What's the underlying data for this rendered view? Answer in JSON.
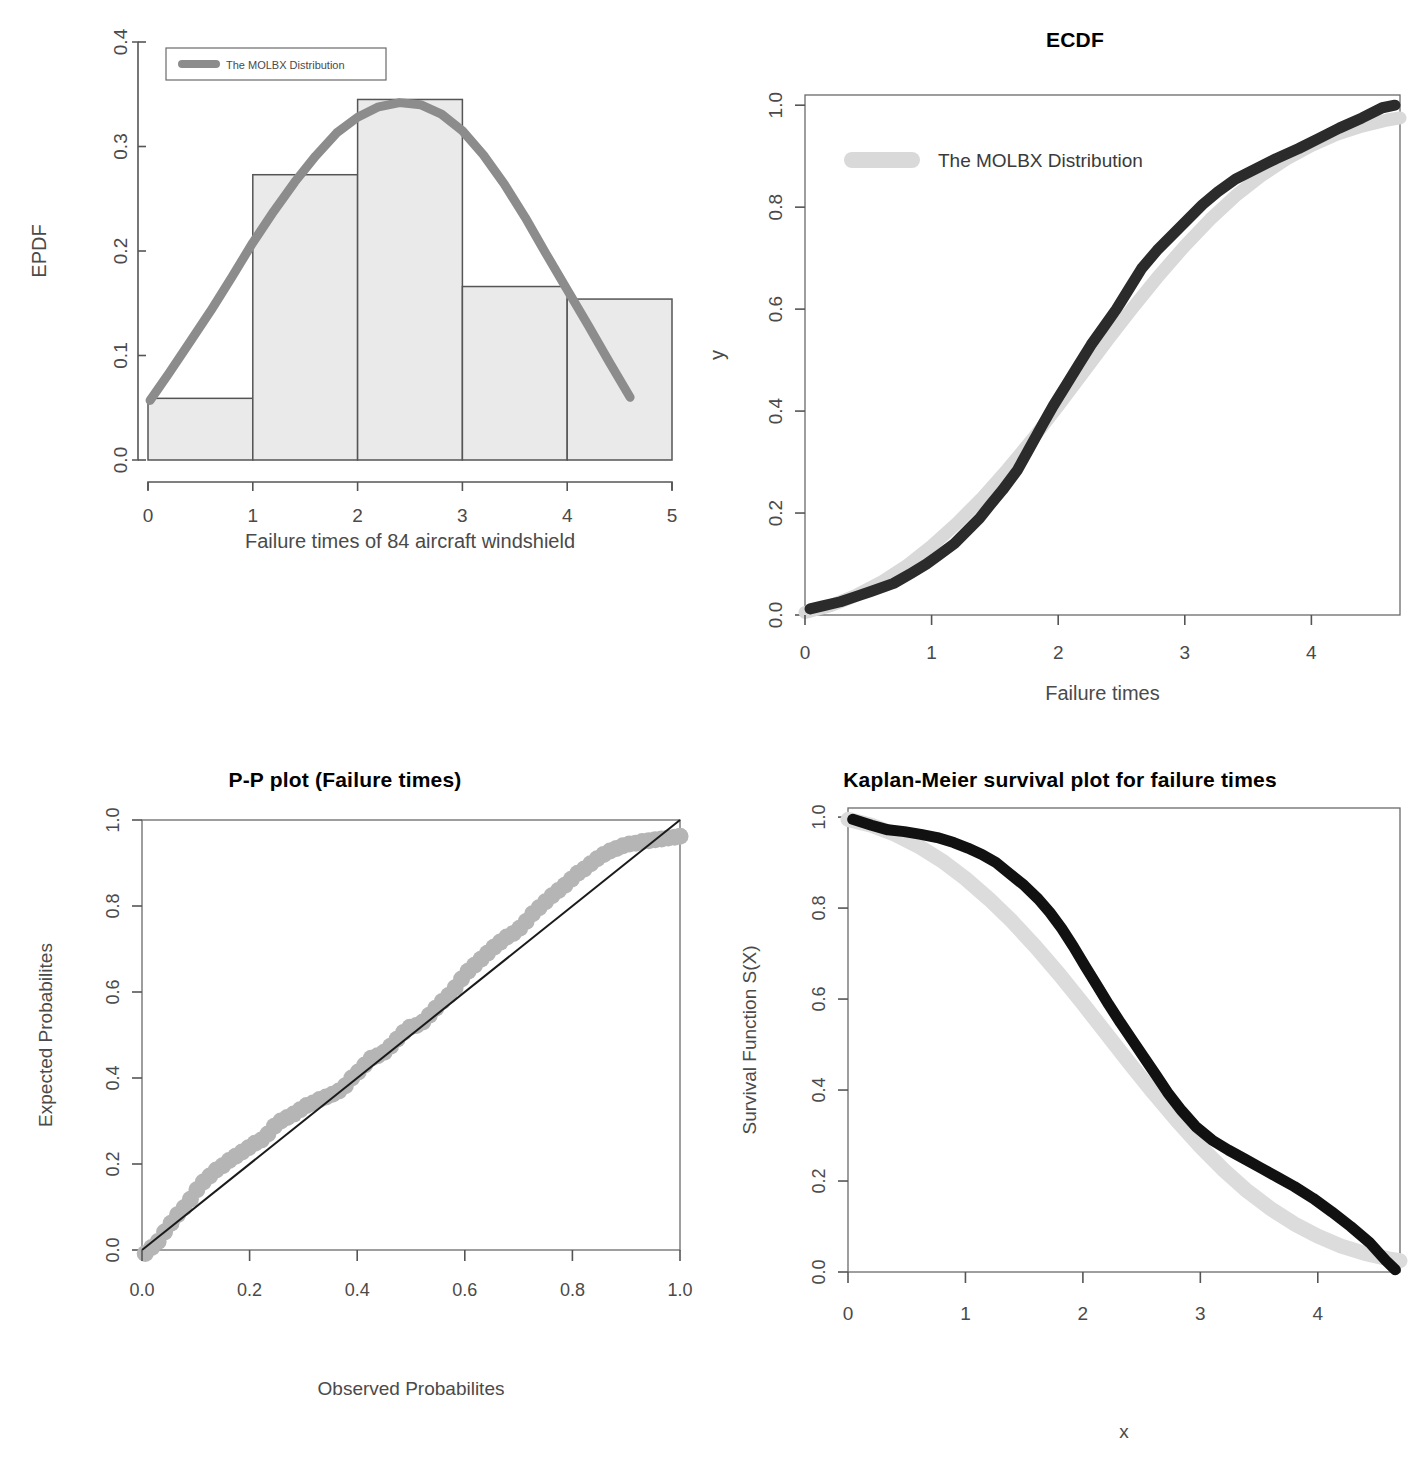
{
  "figure": {
    "background": "#ffffff",
    "panel_count": 4
  },
  "colors": {
    "curve_gray": "#8c8c8c",
    "curve_lightgray": "#d9d9d9",
    "curve_dark": "#2b2b2b",
    "hist_fill": "#eaeaea",
    "hist_stroke": "#555555",
    "axis": "#555555",
    "text": "#3a3a3a",
    "title": "#000000"
  },
  "panels": {
    "epdf": {
      "title": "",
      "xlabel": "Failure times of 84 aircraft windshield",
      "ylabel": "EPDF",
      "legend": {
        "label": "The MOLBX Distribution",
        "swatch_color": "#8c8c8c"
      },
      "xticks": [
        "0",
        "1",
        "2",
        "3",
        "4",
        "5"
      ],
      "yticks": [
        "0.0",
        "0.1",
        "0.2",
        "0.3",
        "0.4"
      ]
    },
    "ecdf": {
      "title": "ECDF",
      "xlabel": "Failure times",
      "ylabel": "y",
      "legend": {
        "label": "The MOLBX Distribution",
        "swatch_color": "#d9d9d9"
      },
      "xticks": [
        "0",
        "1",
        "2",
        "3",
        "4"
      ],
      "yticks": [
        "0.0",
        "0.2",
        "0.4",
        "0.6",
        "0.8",
        "1.0"
      ]
    },
    "pp": {
      "title": "P-P plot (Failure times)",
      "xlabel": "Observed Probabilites",
      "ylabel": "Expected Probabilites",
      "xticks": [
        "0.0",
        "0.2",
        "0.4",
        "0.6",
        "0.8",
        "1.0"
      ],
      "yticks": [
        "0.0",
        "0.2",
        "0.4",
        "0.6",
        "0.8",
        "1.0"
      ]
    },
    "km": {
      "title": "Kaplan-Meier survival plot for failure times",
      "xlabel": "x",
      "ylabel": "Survival  Function S(X)",
      "xticks": [
        "0",
        "1",
        "2",
        "3",
        "4"
      ],
      "yticks": [
        "0.0",
        "0.2",
        "0.4",
        "0.6",
        "0.8",
        "1.0"
      ]
    }
  },
  "chart_data": [
    {
      "id": "epdf",
      "type": "bar",
      "title": "",
      "xlabel": "Failure times of 84 aircraft windshield",
      "ylabel": "EPDF",
      "xlim": [
        0,
        5
      ],
      "ylim": [
        0,
        0.4
      ],
      "grid": false,
      "legend": [
        "The MOLBX Distribution"
      ],
      "legend_position": "top-left",
      "bin_edges": [
        0,
        1,
        2,
        3,
        4,
        5
      ],
      "categories": [
        "0-1",
        "1-2",
        "2-3",
        "3-4",
        "4-5"
      ],
      "values": [
        0.059,
        0.273,
        0.345,
        0.166,
        0.154
      ],
      "overlay_series": {
        "name": "The MOLBX Distribution",
        "color": "#8c8c8c",
        "x": [
          0.02,
          0.2,
          0.4,
          0.6,
          0.8,
          1.0,
          1.2,
          1.4,
          1.6,
          1.8,
          2.0,
          2.2,
          2.4,
          2.6,
          2.8,
          3.0,
          3.2,
          3.4,
          3.6,
          3.8,
          4.0,
          4.2,
          4.4,
          4.6
        ],
        "y": [
          0.057,
          0.083,
          0.113,
          0.143,
          0.175,
          0.208,
          0.238,
          0.266,
          0.291,
          0.313,
          0.328,
          0.338,
          0.342,
          0.34,
          0.331,
          0.315,
          0.292,
          0.264,
          0.232,
          0.197,
          0.163,
          0.129,
          0.094,
          0.06
        ]
      }
    },
    {
      "id": "ecdf",
      "type": "line",
      "title": "ECDF",
      "xlabel": "Failure times",
      "ylabel": "y",
      "xlim": [
        0,
        4.7
      ],
      "ylim": [
        0,
        1.02
      ],
      "grid": false,
      "legend": [
        "The MOLBX Distribution"
      ],
      "legend_position": "top-left",
      "series": [
        {
          "name": "Empirical CDF",
          "color": "#2b2b2b",
          "x": [
            0.04,
            0.14,
            0.28,
            0.4,
            0.52,
            0.7,
            0.84,
            0.96,
            1.06,
            1.18,
            1.28,
            1.38,
            1.46,
            1.56,
            1.68,
            1.78,
            1.88,
            1.96,
            2.06,
            2.16,
            2.26,
            2.36,
            2.46,
            2.56,
            2.66,
            2.78,
            2.9,
            3.02,
            3.14,
            3.26,
            3.4,
            3.56,
            3.72,
            3.9,
            4.06,
            4.22,
            4.4,
            4.56,
            4.66
          ],
          "y": [
            0.012,
            0.018,
            0.026,
            0.036,
            0.046,
            0.062,
            0.082,
            0.1,
            0.118,
            0.14,
            0.165,
            0.19,
            0.215,
            0.245,
            0.285,
            0.33,
            0.375,
            0.41,
            0.45,
            0.49,
            0.53,
            0.565,
            0.6,
            0.64,
            0.68,
            0.715,
            0.745,
            0.775,
            0.805,
            0.83,
            0.855,
            0.875,
            0.895,
            0.915,
            0.935,
            0.955,
            0.975,
            0.995,
            1.0
          ]
        },
        {
          "name": "The MOLBX Distribution",
          "color": "#d9d9d9",
          "x": [
            0.0,
            0.2,
            0.4,
            0.6,
            0.8,
            1.0,
            1.2,
            1.4,
            1.6,
            1.8,
            2.0,
            2.2,
            2.4,
            2.6,
            2.8,
            3.0,
            3.2,
            3.4,
            3.6,
            3.8,
            4.0,
            4.2,
            4.4,
            4.6,
            4.7
          ],
          "y": [
            0.005,
            0.018,
            0.038,
            0.064,
            0.096,
            0.135,
            0.18,
            0.23,
            0.286,
            0.346,
            0.41,
            0.476,
            0.542,
            0.606,
            0.667,
            0.724,
            0.776,
            0.822,
            0.861,
            0.894,
            0.921,
            0.943,
            0.959,
            0.971,
            0.975
          ]
        }
      ]
    },
    {
      "id": "pp",
      "type": "scatter",
      "title": "P-P plot (Failure times)",
      "xlabel": "Observed Probabilites",
      "ylabel": "Expected Probabilites",
      "xlim": [
        0,
        1
      ],
      "ylim": [
        0,
        1
      ],
      "grid": false,
      "reference_line": {
        "from": [
          0,
          0
        ],
        "to": [
          1,
          1
        ],
        "color": "#1a1a1a"
      },
      "series": [
        {
          "name": "P-P points",
          "color": "#b5b5b5",
          "x": [
            0.006,
            0.018,
            0.03,
            0.042,
            0.054,
            0.066,
            0.078,
            0.09,
            0.102,
            0.114,
            0.126,
            0.138,
            0.15,
            0.162,
            0.174,
            0.186,
            0.198,
            0.21,
            0.222,
            0.234,
            0.246,
            0.258,
            0.27,
            0.282,
            0.294,
            0.306,
            0.318,
            0.33,
            0.342,
            0.354,
            0.366,
            0.378,
            0.39,
            0.402,
            0.414,
            0.426,
            0.438,
            0.45,
            0.462,
            0.474,
            0.486,
            0.498,
            0.51,
            0.522,
            0.534,
            0.546,
            0.558,
            0.57,
            0.582,
            0.594,
            0.606,
            0.618,
            0.63,
            0.642,
            0.654,
            0.666,
            0.678,
            0.69,
            0.702,
            0.714,
            0.726,
            0.738,
            0.75,
            0.762,
            0.774,
            0.786,
            0.798,
            0.81,
            0.822,
            0.834,
            0.846,
            0.858,
            0.87,
            0.882,
            0.894,
            0.906,
            0.918,
            0.93,
            0.942,
            0.954,
            0.966,
            0.978,
            0.99,
            1.0
          ],
          "y": [
            -0.008,
            0.006,
            0.02,
            0.042,
            0.062,
            0.082,
            0.098,
            0.118,
            0.14,
            0.158,
            0.172,
            0.186,
            0.196,
            0.208,
            0.218,
            0.228,
            0.238,
            0.248,
            0.256,
            0.27,
            0.288,
            0.3,
            0.308,
            0.316,
            0.326,
            0.336,
            0.342,
            0.35,
            0.356,
            0.362,
            0.37,
            0.382,
            0.4,
            0.414,
            0.43,
            0.446,
            0.452,
            0.46,
            0.474,
            0.49,
            0.506,
            0.518,
            0.522,
            0.53,
            0.546,
            0.562,
            0.578,
            0.592,
            0.61,
            0.63,
            0.648,
            0.662,
            0.676,
            0.69,
            0.704,
            0.716,
            0.728,
            0.736,
            0.748,
            0.764,
            0.782,
            0.796,
            0.81,
            0.824,
            0.836,
            0.848,
            0.862,
            0.876,
            0.886,
            0.898,
            0.91,
            0.92,
            0.928,
            0.934,
            0.94,
            0.944,
            0.946,
            0.95,
            0.952,
            0.954,
            0.956,
            0.958,
            0.96,
            0.962
          ]
        }
      ]
    },
    {
      "id": "km",
      "type": "line",
      "title": "Kaplan-Meier survival plot for failure times",
      "xlabel": "x",
      "ylabel": "Survival  Function S(X)",
      "xlim": [
        0,
        4.7
      ],
      "ylim": [
        0,
        1.02
      ],
      "grid": false,
      "series": [
        {
          "name": "Kaplan-Meier estimate",
          "color": "#111111",
          "x": [
            0.04,
            0.2,
            0.34,
            0.48,
            0.62,
            0.76,
            0.9,
            1.02,
            1.14,
            1.26,
            1.38,
            1.5,
            1.62,
            1.72,
            1.82,
            1.92,
            2.02,
            2.12,
            2.22,
            2.32,
            2.42,
            2.52,
            2.62,
            2.72,
            2.84,
            2.96,
            3.1,
            3.24,
            3.38,
            3.52,
            3.66,
            3.8,
            3.96,
            4.12,
            4.28,
            4.44,
            4.58,
            4.66
          ],
          "y": [
            0.995,
            0.982,
            0.972,
            0.968,
            0.962,
            0.955,
            0.944,
            0.932,
            0.918,
            0.9,
            0.875,
            0.85,
            0.82,
            0.79,
            0.755,
            0.715,
            0.672,
            0.63,
            0.588,
            0.548,
            0.51,
            0.472,
            0.434,
            0.395,
            0.355,
            0.32,
            0.29,
            0.268,
            0.248,
            0.228,
            0.208,
            0.188,
            0.162,
            0.132,
            0.1,
            0.065,
            0.025,
            0.005
          ]
        },
        {
          "name": "The MOLBX Distribution",
          "color": "#dcdcdc",
          "x": [
            0.0,
            0.2,
            0.4,
            0.6,
            0.8,
            1.0,
            1.2,
            1.4,
            1.6,
            1.8,
            2.0,
            2.2,
            2.4,
            2.6,
            2.8,
            3.0,
            3.2,
            3.4,
            3.6,
            3.8,
            4.0,
            4.2,
            4.4,
            4.6,
            4.7
          ],
          "y": [
            0.995,
            0.982,
            0.962,
            0.936,
            0.904,
            0.865,
            0.82,
            0.77,
            0.714,
            0.654,
            0.59,
            0.524,
            0.458,
            0.394,
            0.333,
            0.276,
            0.224,
            0.178,
            0.139,
            0.106,
            0.079,
            0.057,
            0.041,
            0.029,
            0.025
          ]
        }
      ]
    }
  ]
}
